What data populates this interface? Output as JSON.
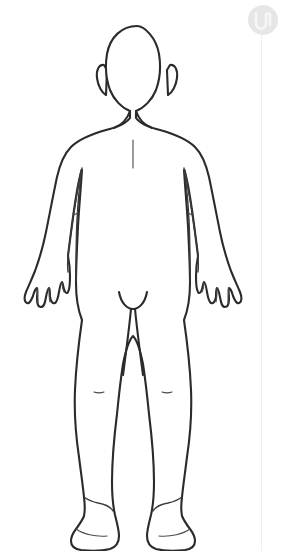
{
  "page": {
    "background_color": "#ffffff",
    "width": 283,
    "height": 551
  },
  "illustration": {
    "name": "human-body-outline",
    "view": "anterior",
    "description": "Line-art outline drawing of a standing human figure, front view, arms at sides",
    "line_color": "#2b2b2b",
    "fill_color": "#ffffff",
    "parts": [
      "head",
      "ears",
      "neck",
      "shoulders",
      "chest",
      "sternum-line",
      "left-arm",
      "right-arm",
      "left-hand",
      "right-hand",
      "torso",
      "waist",
      "hips",
      "groin",
      "left-leg",
      "right-leg",
      "knees",
      "left-foot",
      "right-foot"
    ]
  },
  "watermark": {
    "icon_name": "u-logo-watermark",
    "glyph": "U",
    "color": "#e3e3e3",
    "guide_line_color": "#eeeeee"
  }
}
